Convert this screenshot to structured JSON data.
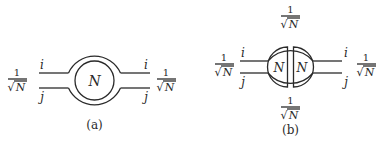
{
  "figure": {
    "panels": [
      {
        "id": "a",
        "caption": "(a)",
        "center_label": "N",
        "left": {
          "factor_num": "1",
          "factor_den": "N",
          "index_top": "i",
          "index_bottom": "j"
        },
        "right": {
          "factor_num": "1",
          "factor_den": "N",
          "index_top": "i",
          "index_bottom": "j"
        }
      },
      {
        "id": "b",
        "caption": "(b)",
        "left_half_label": "N",
        "right_half_label": "N",
        "top": {
          "factor_num": "1",
          "factor_den": "N"
        },
        "bottom": {
          "factor_num": "1",
          "factor_den": "N"
        },
        "left": {
          "factor_num": "1",
          "factor_den": "N",
          "index_top": "i",
          "index_bottom": "j"
        },
        "right": {
          "factor_num": "1",
          "factor_den": "N",
          "index_top": "i",
          "index_bottom": "j"
        }
      }
    ],
    "sqrt_symbol": "√"
  }
}
